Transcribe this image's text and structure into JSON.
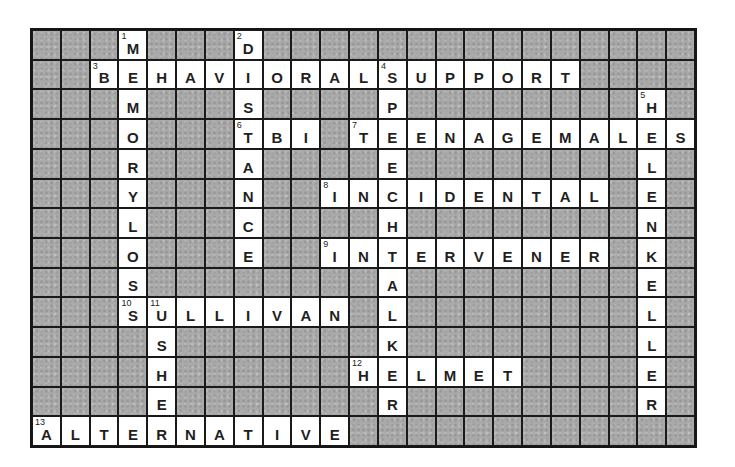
{
  "puzzle": {
    "type": "crossword",
    "cols": 23,
    "rows": 14,
    "colors": {
      "block": "#a9a9a9",
      "open": "#ffffff",
      "grid_line": "#1a1a1a",
      "text": "#1f1f1f"
    },
    "entries": [
      {
        "number": 1,
        "direction": "down",
        "row": 0,
        "col": 3,
        "answer": "MEMORYLOSS"
      },
      {
        "number": 2,
        "direction": "down",
        "row": 0,
        "col": 7,
        "answer": "DISTANCE"
      },
      {
        "number": 3,
        "direction": "across",
        "row": 1,
        "col": 2,
        "answer": "BEHAVIORALSUPPORT"
      },
      {
        "number": 4,
        "direction": "down",
        "row": 1,
        "col": 12,
        "answer": "SPEECHTALKER"
      },
      {
        "number": 5,
        "direction": "down",
        "row": 2,
        "col": 21,
        "answer": "HELENKELLER"
      },
      {
        "number": 6,
        "direction": "across",
        "row": 3,
        "col": 7,
        "answer": "TBI"
      },
      {
        "number": 7,
        "direction": "across",
        "row": 3,
        "col": 11,
        "answer": "TEENAGEMALES"
      },
      {
        "number": 8,
        "direction": "across",
        "row": 5,
        "col": 10,
        "answer": "INCIDENTAL"
      },
      {
        "number": 9,
        "direction": "across",
        "row": 7,
        "col": 10,
        "answer": "INTERVENER"
      },
      {
        "number": 10,
        "direction": "across",
        "row": 9,
        "col": 3,
        "answer": "SULLIVAN"
      },
      {
        "number": 11,
        "direction": "down",
        "row": 9,
        "col": 4,
        "answer": "USHER"
      },
      {
        "number": 12,
        "direction": "across",
        "row": 11,
        "col": 11,
        "answer": "HELMET"
      },
      {
        "number": 13,
        "direction": "across",
        "row": 13,
        "col": 0,
        "answer": "ALTERNATIVE"
      }
    ]
  }
}
